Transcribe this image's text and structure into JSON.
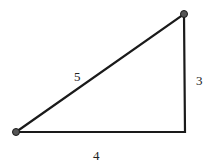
{
  "diagram": {
    "type": "right-triangle",
    "vertices": {
      "bottom_left": {
        "x": 16,
        "y": 132
      },
      "top_right": {
        "x": 184,
        "y": 14
      },
      "right_angle": {
        "x": 185,
        "y": 132
      }
    },
    "sides": {
      "hypotenuse": {
        "label": "5"
      },
      "vertical": {
        "label": "3"
      },
      "horizontal": {
        "label": "4"
      }
    },
    "colors": {
      "stroke": "#1a1a1a",
      "vertex_dot": "#555555",
      "background": "#ffffff"
    }
  }
}
